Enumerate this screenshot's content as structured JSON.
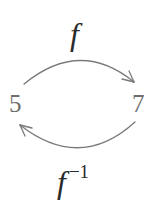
{
  "diagram": {
    "nodes": [
      {
        "id": "left",
        "label": "5"
      },
      {
        "id": "right",
        "label": "7"
      }
    ],
    "edges": [
      {
        "from": "left",
        "to": "right",
        "label": "f",
        "position": "top"
      },
      {
        "from": "right",
        "to": "left",
        "label": "f",
        "superscript": "−1",
        "position": "bottom"
      }
    ],
    "colors": {
      "arrow": "#7a7a7a",
      "node_text": "#6e6e6e",
      "function_label": "#2a2a2a",
      "background": "#ffffff"
    }
  }
}
